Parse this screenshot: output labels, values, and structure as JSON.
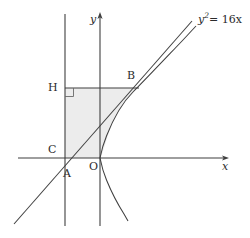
{
  "figure": {
    "background_color": "#ffffff",
    "stroke_color": "#3a3a3a",
    "shade_color": "#ebebeb",
    "width": 250,
    "height": 238
  },
  "equation": {
    "base": "y",
    "exponent": "2",
    "rest": "= 16x",
    "full": "y² = 16x"
  },
  "axes": {
    "x_label": "x",
    "y_label": "y",
    "origin_label": "O",
    "x_axis_y": 158,
    "y_axis_x": 100,
    "x_axis_start": 18,
    "x_axis_end": 228,
    "y_axis_top": 14,
    "y_axis_bottom": 226
  },
  "points": [
    {
      "name": "H",
      "label": "H",
      "x": 65,
      "y": 88,
      "label_x": 48,
      "label_y": 82
    },
    {
      "name": "B",
      "label": "B",
      "x": 138,
      "y": 88,
      "label_x": 128,
      "label_y": 71
    },
    {
      "name": "C",
      "label": "C",
      "x": 65,
      "y": 158,
      "label_x": 48,
      "label_y": 144
    },
    {
      "name": "A",
      "label": "A",
      "x": 68,
      "y": 166,
      "label_x": 64,
      "label_y": 170
    },
    {
      "name": "O",
      "label": "O",
      "x": 100,
      "y": 158,
      "label_x": 90,
      "label_y": 162
    }
  ],
  "elements": {
    "directrix_line": "vertical line x=65",
    "tangent_line": "line through A and B",
    "parabola_curve": "y^2 = 16x",
    "segment_HB": "horizontal segment from H to B",
    "right_angle_marker": "right angle at H",
    "shaded_region": "trapezoid H-B-curve-C"
  }
}
